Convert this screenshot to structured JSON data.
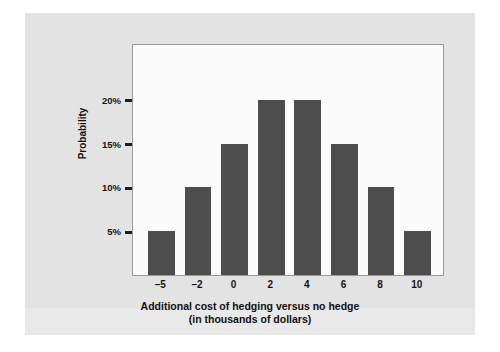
{
  "chart_data": {
    "type": "bar",
    "title": "",
    "subtitle": "",
    "xlabel": "Additional cost of hedging versus no hedge",
    "xlabel_line2": "(in thousands of dollars)",
    "ylabel": "Probability",
    "categories": [
      "–5",
      "–2",
      "0",
      "2",
      "4",
      "6",
      "8",
      "10"
    ],
    "values": [
      5,
      10,
      15,
      20,
      20,
      15,
      10,
      5
    ],
    "value_labels": [
      "5%",
      "10%",
      "15%",
      "20%",
      "20%",
      "15%",
      "10%",
      "5%"
    ],
    "ytick_labels": [
      "5%",
      "10%",
      "15%",
      "20%"
    ],
    "ytick_values": [
      5,
      10,
      15,
      20
    ],
    "ylim": [
      0,
      26.5
    ],
    "xlim_note": "categorical, 8 equally spaced bars",
    "grid": false,
    "legend": "none",
    "bar_color": "#4d4d4d",
    "plot_background": "#fbfbfb",
    "panel_background": "#e3e3e3",
    "frame_color": "#9a9a9a",
    "axis_text_color": "#141414"
  },
  "figure": {
    "panel_label": "figure-panel",
    "plot_area_label": "plot-area"
  }
}
